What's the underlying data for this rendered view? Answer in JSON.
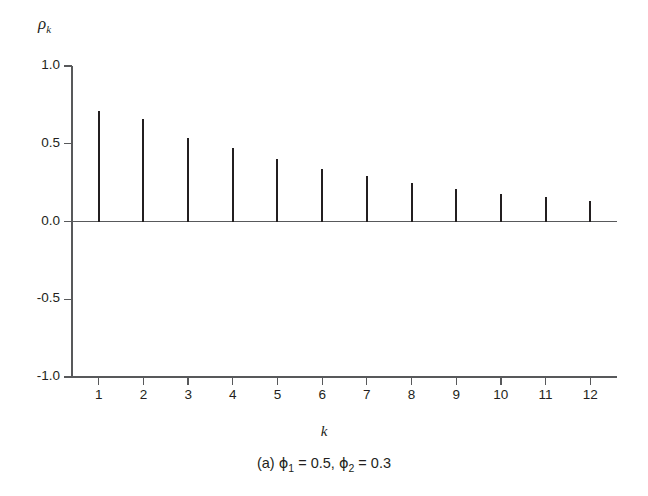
{
  "chart_data": {
    "type": "bar",
    "title": "",
    "subtitle": "",
    "caption": "(a) ϕ₁ = 0.5, ϕ₂ = 0.3",
    "caption_parts": {
      "prefix": "(a)",
      "phi_symbol": "ϕ",
      "sub1": "1",
      "eq1": "= 0.5,",
      "sub2": "2",
      "eq2": "= 0.3"
    },
    "xlabel": "k",
    "ylabel": "ρ",
    "ylabel_sub": "k",
    "categories": [
      "1",
      "2",
      "3",
      "4",
      "5",
      "6",
      "7",
      "8",
      "9",
      "10",
      "11",
      "12"
    ],
    "x": [
      1,
      2,
      3,
      4,
      5,
      6,
      7,
      8,
      9,
      10,
      11,
      12
    ],
    "values": [
      0.71,
      0.66,
      0.54,
      0.47,
      0.4,
      0.34,
      0.29,
      0.25,
      0.21,
      0.18,
      0.16,
      0.13
    ],
    "ylim": [
      -1.0,
      1.0
    ],
    "xlim": [
      0.4,
      12.6
    ],
    "yticks": [
      1.0,
      0.5,
      0.0,
      -0.5,
      -1.0
    ],
    "ytick_labels": [
      "1.0",
      "0.5",
      "0.0",
      "-0.5",
      "-1.0"
    ],
    "xticks": [
      1,
      2,
      3,
      4,
      5,
      6,
      7,
      8,
      9,
      10,
      11,
      12
    ],
    "xtick_labels": [
      "1",
      "2",
      "3",
      "4",
      "5",
      "6",
      "7",
      "8",
      "9",
      "10",
      "11",
      "12"
    ],
    "grid": false,
    "legend": null,
    "legend_position": "none",
    "series_color": "#231f20",
    "axis_color": "#58595b"
  },
  "figure": {
    "background": "#ffffff",
    "foreground": "#231f20"
  }
}
